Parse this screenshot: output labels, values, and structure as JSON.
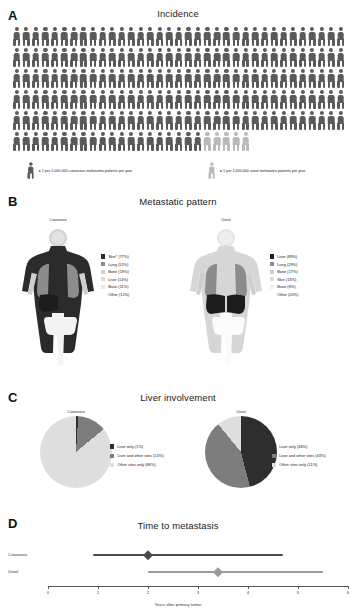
{
  "figure": {
    "colors": {
      "cutaneous_dark": "#5a5a5a",
      "uveal_light": "#b9b9b9",
      "skin_dark": "#2b2b2b",
      "lung_mid": "#8c8c8c",
      "bone_light": "#cfcfcf",
      "liver_dark": "#1c1c1c",
      "brain_pale": "#e2e2e2",
      "pie_dark": "#2e2e2e",
      "pie_mid": "#7d7d7d",
      "pie_light": "#dedede",
      "forest_cutaneous": "#4a4a4a",
      "forest_uveal": "#9a9a9a"
    }
  },
  "panelA": {
    "letter": "A",
    "title": "Incidence",
    "figures_per_row": 35,
    "rows": 6,
    "cutaneous_count": 195,
    "uveal_count": 5,
    "legend": [
      {
        "icon": "person-icon-dark",
        "text": "= 1 per 1,000,000 cutaneous melanoma patients per year"
      },
      {
        "icon": "person-icon-light",
        "text": "= 1 per 1,000,000 uveal melanoma patients per year"
      }
    ]
  },
  "panelB": {
    "letter": "B",
    "title": "Metastatic pattern",
    "cutaneous": {
      "sub_label": "Cutaneous",
      "legend": [
        {
          "label": "Skin* (77%)",
          "color": "#2b2b2b"
        },
        {
          "label": "Lung (51%)",
          "color": "#8c8c8c"
        },
        {
          "label": "Bone (19%)",
          "color": "#cfcfcf"
        },
        {
          "label": "Liver (14%)",
          "color": "#dcdcdc"
        },
        {
          "label": "Brain (11%)",
          "color": "#e8e8e8"
        },
        {
          "label": "Other (12%)",
          "color": "none"
        }
      ]
    },
    "uveal": {
      "sub_label": "Uveal",
      "legend": [
        {
          "label": "Liver (89%)",
          "color": "#1c1c1c"
        },
        {
          "label": "Lung (29%)",
          "color": "#8c8c8c"
        },
        {
          "label": "Bone (17%)",
          "color": "#cfcfcf"
        },
        {
          "label": "Skin (13%)",
          "color": "#dcdcdc"
        },
        {
          "label": "Brain (8%)",
          "color": "#eeeeee"
        },
        {
          "label": "Other (20%)",
          "color": "none"
        }
      ]
    }
  },
  "panelC": {
    "letter": "C",
    "title": "Liver involvement",
    "cutaneous": {
      "sub_label": "Cutaneous",
      "legend": [
        {
          "label": "Liver only (1%)",
          "color": "#2e2e2e"
        },
        {
          "label": "Liver and other sites (13%)",
          "color": "#7d7d7d"
        },
        {
          "label": "Other sites only (86%)",
          "color": "#dedede"
        }
      ]
    },
    "uveal": {
      "sub_label": "Uveal",
      "legend": [
        {
          "label": "Liver only (46%)",
          "color": "#2e2e2e"
        },
        {
          "label": "Liver and other sites (43%)",
          "color": "#7d7d7d"
        },
        {
          "label": "Other sites only (11%)",
          "color": "#dedede"
        }
      ]
    }
  },
  "panelD": {
    "letter": "D",
    "title": "Time to metastasis",
    "axis_title": "Years after primary tumor",
    "ticks": [
      "0",
      "1",
      "2",
      "3",
      "4",
      "5",
      "6"
    ],
    "rows": [
      {
        "label": "Cutaneous",
        "low": 0.9,
        "median": 2.0,
        "high": 4.7,
        "color": "#4a4a4a"
      },
      {
        "label": "Uveal",
        "low": 2.0,
        "median": 3.4,
        "high": 5.5,
        "color": "#9a9a9a"
      }
    ]
  },
  "chart_data": [
    {
      "type": "pictogram",
      "title": "Incidence",
      "panel": "A",
      "unit": "1 per 1,000,000 patients per year",
      "categories": [
        "Cutaneous melanoma",
        "Uveal melanoma"
      ],
      "values": [
        195,
        5
      ],
      "notes": "Each icon represents 1 case per 1,000,000 persons per year; dark icons = cutaneous, light icons = uveal"
    },
    {
      "type": "bar",
      "title": "Metastatic pattern - Cutaneous",
      "panel": "B",
      "categories": [
        "Skin*",
        "Lung",
        "Bone",
        "Liver",
        "Brain",
        "Other"
      ],
      "values": [
        77,
        51,
        19,
        14,
        11,
        12
      ],
      "xlabel": "Metastatic site",
      "ylabel": "Percent of patients (%)",
      "ylim": [
        0,
        100
      ]
    },
    {
      "type": "bar",
      "title": "Metastatic pattern - Uveal",
      "panel": "B",
      "categories": [
        "Liver",
        "Lung",
        "Bone",
        "Skin",
        "Brain",
        "Other"
      ],
      "values": [
        89,
        29,
        17,
        13,
        8,
        20
      ],
      "xlabel": "Metastatic site",
      "ylabel": "Percent of patients (%)",
      "ylim": [
        0,
        100
      ]
    },
    {
      "type": "pie",
      "title": "Liver involvement - Cutaneous",
      "panel": "C",
      "categories": [
        "Liver only",
        "Liver and other sites",
        "Other sites only"
      ],
      "values": [
        1,
        13,
        86
      ],
      "legend_position": "right"
    },
    {
      "type": "pie",
      "title": "Liver involvement - Uveal",
      "panel": "C",
      "categories": [
        "Liver only",
        "Liver and other sites",
        "Other sites only"
      ],
      "values": [
        46,
        43,
        11
      ],
      "legend_position": "right"
    },
    {
      "type": "scatter",
      "title": "Time to metastasis",
      "panel": "D",
      "xlabel": "Years after primary tumor",
      "xlim": [
        0,
        6
      ],
      "grid": false,
      "categories": [
        "Cutaneous",
        "Uveal"
      ],
      "series": [
        {
          "name": "Cutaneous",
          "median": 2.0,
          "range_low": 0.9,
          "range_high": 4.7
        },
        {
          "name": "Uveal",
          "median": 3.4,
          "range_low": 2.0,
          "range_high": 5.5
        }
      ]
    }
  ]
}
